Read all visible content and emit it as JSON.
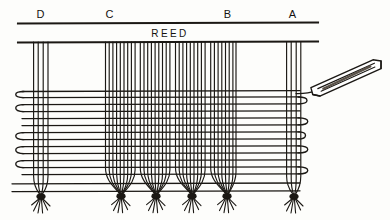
{
  "figure": {
    "kind": "line-drawing",
    "background_color": "#fdfdfb",
    "ink_color": "#1b1814"
  },
  "reed": {
    "label": "REED",
    "top_rule_y": 23,
    "bottom_rule_y": 42,
    "x_start": 18,
    "x_end": 318,
    "label_x": 170,
    "label_y": 36
  },
  "section_labels": [
    {
      "id": "label-d",
      "text": "D",
      "x": 41,
      "y": 18
    },
    {
      "id": "label-c",
      "text": "C",
      "x": 110,
      "y": 18
    },
    {
      "id": "label-b",
      "text": "B",
      "x": 228,
      "y": 18
    },
    {
      "id": "label-a",
      "text": "A",
      "x": 293,
      "y": 18
    }
  ],
  "warp_groups": [
    {
      "id": "warp-group-d",
      "label": "D",
      "x_start": 33,
      "x_end": 49,
      "count": 4,
      "bundled": true,
      "bundle_x": 41
    },
    {
      "id": "warp-group-c",
      "label": "C",
      "x_start": 105,
      "x_end": 235,
      "count": 36,
      "bundled": true,
      "bundle_count": 4
    },
    {
      "id": "warp-group-a",
      "label": "A",
      "x_start": 286,
      "x_end": 301,
      "count": 4,
      "bundled": true,
      "bundle_x": 294
    }
  ],
  "weft": {
    "line_color": "#1b1814",
    "rows_y": [
      91,
      103,
      117,
      130,
      144,
      157,
      171,
      184,
      191
    ],
    "left_selvedge_x": 22,
    "right_selvedge_x": 312,
    "loop_rows_left": [
      95,
      111,
      138,
      152,
      166
    ],
    "loop_rows_right": [
      100,
      124,
      150,
      176
    ]
  },
  "shuttle": {
    "id": "shuttle",
    "description": "weaving shuttle held at angle with thread trailing into the shed",
    "center_x": 345,
    "center_y": 82,
    "length": 78,
    "height": 13,
    "angle_deg": -22,
    "thread_entry_x": 312,
    "thread_entry_y": 93
  },
  "fringe": {
    "description": "knotted tassel bundles at the lower edge where warp threads are tied off",
    "y_knot": 196,
    "y_tip": 214,
    "bundles_x": [
      41,
      121,
      156,
      192,
      227,
      294
    ]
  }
}
